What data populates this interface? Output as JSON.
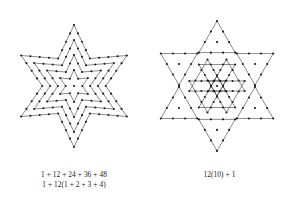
{
  "figure": {
    "background_color": "#ffffff",
    "stroke_color": "#3a3a3a",
    "dot_color": "#1a1a1a",
    "left_panel": {
      "name": "nested-hexagram-rings",
      "description": "Concentric hexagram (Star of David) outlines of dots around one central dot",
      "center": {
        "x": 74,
        "y": 86
      },
      "ring_count": 4,
      "center_dot_count": 1,
      "ring_dot_counts": [
        12,
        24,
        36,
        48
      ],
      "ring_radii": [
        16,
        31,
        46,
        61
      ],
      "star_points": 6,
      "inner_ratio": 0.52,
      "rotation_deg": -90,
      "caption": {
        "line1": "1 + 12 + 24 + 36 + 48",
        "line2": "1 + 12(1 + 2 + 3 + 4)"
      }
    },
    "right_panel": {
      "name": "twelve-triangles-decomposition",
      "description": "Same hexagram split into 12 triangles of 10 dots each plus 1 center dot",
      "center": {
        "x": 69,
        "y": 86
      },
      "triangle_count": 12,
      "dots_per_triangle": 10,
      "perimeter_dots_per_triangle": 9,
      "interior_dots_per_triangle": 1,
      "center_dot_count": 1,
      "dots_per_edge": 4,
      "triangle_side": 38,
      "gap": 1.6,
      "total_dots": 121,
      "caption": {
        "line1": "12(10) + 1"
      }
    }
  }
}
